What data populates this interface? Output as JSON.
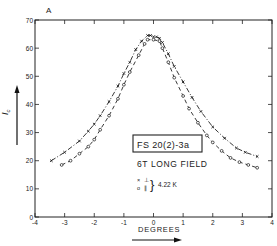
{
  "chart_data": {
    "type": "line",
    "panel_label": "A",
    "title": "",
    "xlabel": "DEGREES",
    "ylabel": "Ic",
    "xlim": [
      -4,
      4
    ],
    "ylim": [
      0,
      70
    ],
    "xticks": [
      -4,
      -3,
      -2,
      -1,
      0,
      1,
      2,
      3,
      4
    ],
    "yticks": [
      0,
      10,
      20,
      30,
      40,
      50,
      60,
      70
    ],
    "grid": false,
    "legend": {
      "box_label": "FS 20(2)-3a",
      "field": "6T LONG FIELD",
      "entries": [
        {
          "marker": "x",
          "label": "⊥"
        },
        {
          "marker": "o",
          "label": "∥"
        }
      ],
      "temperature": "4.22 K",
      "position": "center-right"
    },
    "series": [
      {
        "name": "× ⊥",
        "marker": "x",
        "dash": "5,2,1,2",
        "x": [
          -3.45,
          -3.0,
          -2.5,
          -2.2,
          -2.0,
          -1.8,
          -1.5,
          -1.2,
          -1.0,
          -0.8,
          -0.6,
          -0.4,
          -0.2,
          -0.1,
          0.0,
          0.1,
          0.2,
          0.3,
          0.5,
          0.7,
          1.0,
          1.3,
          1.6,
          2.0,
          2.4,
          2.8,
          3.1,
          3.5
        ],
        "y": [
          20.0,
          23.0,
          27.0,
          30.5,
          33.0,
          36.0,
          41.0,
          46.5,
          51.0,
          55.0,
          59.5,
          62.5,
          64.5,
          64.5,
          64.0,
          64.0,
          63.5,
          62.0,
          58.0,
          53.5,
          48.0,
          42.5,
          37.5,
          32.0,
          28.0,
          24.5,
          23.0,
          21.5
        ]
      },
      {
        "name": "o ∥",
        "marker": "o",
        "dash": "4,3",
        "x": [
          -3.1,
          -2.8,
          -2.5,
          -2.2,
          -2.0,
          -1.8,
          -1.5,
          -1.2,
          -1.0,
          -0.8,
          -0.5,
          -0.3,
          -0.2,
          0.0,
          0.2,
          0.3,
          0.5,
          0.7,
          1.0,
          1.2,
          1.5,
          1.8,
          2.0,
          2.3,
          2.6,
          2.9,
          3.2,
          3.5
        ],
        "y": [
          18.5,
          20.0,
          22.5,
          25.0,
          27.5,
          31.0,
          36.0,
          42.0,
          47.0,
          51.5,
          57.5,
          61.5,
          63.0,
          63.0,
          62.5,
          60.0,
          55.0,
          49.5,
          43.0,
          38.5,
          33.5,
          29.0,
          26.5,
          23.5,
          21.0,
          19.5,
          18.5,
          17.5
        ]
      }
    ]
  }
}
